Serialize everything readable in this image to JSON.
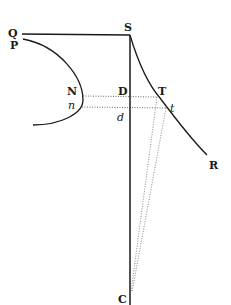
{
  "figure": {
    "type": "geometric-diagram",
    "stroke_color": "#1a1a1a",
    "background": "#ffffff",
    "labels": {
      "Q": "Q",
      "P": "P",
      "S": "S",
      "N": "N",
      "n": "n",
      "D": "D",
      "d": "d",
      "T": "T",
      "t": "t",
      "R": "R",
      "C": "C"
    },
    "elements": [
      {
        "id": "line-QS",
        "kind": "solid-line",
        "from": "Q",
        "to": "S"
      },
      {
        "id": "line-SC",
        "kind": "solid-line",
        "from": "S",
        "to": "C"
      },
      {
        "id": "curve-PNn",
        "kind": "solid-curve",
        "through": [
          "P",
          "N",
          "n"
        ]
      },
      {
        "id": "curve-STtR",
        "kind": "solid-curve",
        "through": [
          "S",
          "T",
          "t",
          "R"
        ]
      },
      {
        "id": "dotted-NDT",
        "kind": "dotted-line",
        "through": [
          "N",
          "D",
          "T"
        ]
      },
      {
        "id": "dotted-ndt",
        "kind": "dotted-line",
        "through": [
          "n",
          "d",
          "t"
        ]
      },
      {
        "id": "dotted-TC",
        "kind": "dotted-line",
        "from": "T",
        "to": "C"
      },
      {
        "id": "dotted-tC",
        "kind": "dotted-line",
        "from": "t",
        "to": "C"
      }
    ]
  }
}
